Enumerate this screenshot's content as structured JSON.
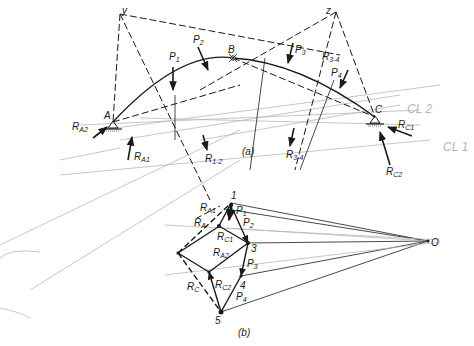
{
  "diagram": {
    "type": "three-hinged arch graphical analysis with force polygon",
    "part_a": {
      "caption": "(a)",
      "points": {
        "y": {
          "label": "y",
          "x": 120,
          "y": 14
        },
        "z": {
          "label": "z",
          "x": 336,
          "y": 12
        },
        "A": {
          "label": "A",
          "x": 113,
          "y": 122
        },
        "B": {
          "label": "B",
          "x": 233,
          "y": 58
        },
        "C": {
          "label": "C",
          "x": 375,
          "y": 117
        }
      },
      "loads": [
        {
          "label": "P",
          "sub": "1"
        },
        {
          "label": "P",
          "sub": "2"
        },
        {
          "label": "P",
          "sub": "3"
        },
        {
          "label": "P",
          "sub": "4"
        }
      ],
      "resultants": [
        {
          "label": "R",
          "sub": "1-2"
        },
        {
          "label": "R",
          "sub": "3-4"
        }
      ],
      "reactions": [
        {
          "label": "R",
          "sub": "A2"
        },
        {
          "label": "R",
          "sub": "A1"
        },
        {
          "label": "R",
          "sub": "C1"
        },
        {
          "label": "R",
          "sub": "C2"
        }
      ],
      "pencil_notes": [
        "CL 2",
        "CL 1"
      ]
    },
    "part_b": {
      "caption": "(b)",
      "pole": "O",
      "vertices": [
        "1",
        "2",
        "3",
        "4",
        "5"
      ],
      "vectors": [
        {
          "label": "P",
          "sub": "1"
        },
        {
          "label": "P",
          "sub": "2"
        },
        {
          "label": "P",
          "sub": "3"
        },
        {
          "label": "P",
          "sub": "4"
        },
        {
          "label": "R",
          "sub": "A1"
        },
        {
          "label": "R",
          "sub": "A"
        },
        {
          "label": "R",
          "sub": "C1"
        },
        {
          "label": "R",
          "sub": "A2"
        },
        {
          "label": "R",
          "sub": "C2"
        },
        {
          "label": "R",
          "sub": "C"
        }
      ]
    }
  }
}
